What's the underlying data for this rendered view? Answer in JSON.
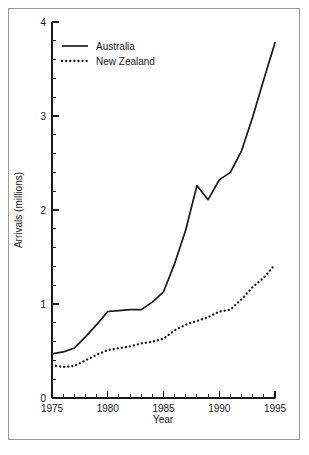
{
  "chart_data": {
    "type": "line",
    "title": "",
    "xlabel": "Year",
    "ylabel": "Arrivals (millions)",
    "xlim": [
      1975,
      1995
    ],
    "ylim": [
      0,
      4
    ],
    "grid": false,
    "legend_position": "top-left",
    "x_major_ticks": [
      1975,
      1980,
      1985,
      1990,
      1995
    ],
    "x_major_tick_labels": [
      "1975",
      "1980",
      "1985",
      "1990",
      "1995"
    ],
    "x_minor_tick_step": 1,
    "y_major_ticks": [
      0,
      1,
      2,
      3,
      4
    ],
    "y_major_tick_labels": [
      "0",
      "1",
      "2",
      "3",
      "4"
    ],
    "y_minor_tick_step": 0.2,
    "x": [
      1975,
      1976,
      1977,
      1978,
      1979,
      1980,
      1981,
      1982,
      1983,
      1984,
      1985,
      1986,
      1987,
      1988,
      1989,
      1990,
      1991,
      1992,
      1993,
      1994,
      1995
    ],
    "series": [
      {
        "name": "Australia",
        "style": "solid",
        "color": "#1a1a1a",
        "values": [
          0.47,
          0.49,
          0.53,
          0.65,
          0.78,
          0.92,
          0.93,
          0.94,
          0.94,
          1.02,
          1.13,
          1.43,
          1.79,
          2.26,
          2.11,
          2.32,
          2.4,
          2.63,
          2.99,
          3.39,
          3.78
        ]
      },
      {
        "name": "New Zealand",
        "style": "dotted",
        "color": "#1a1a1a",
        "values": [
          0.35,
          0.33,
          0.34,
          0.4,
          0.46,
          0.51,
          0.53,
          0.55,
          0.58,
          0.6,
          0.63,
          0.72,
          0.78,
          0.82,
          0.86,
          0.92,
          0.94,
          1.05,
          1.18,
          1.28,
          1.42
        ]
      }
    ]
  },
  "legend": {
    "entries": [
      {
        "label": "Australia"
      },
      {
        "label": "New Zealand"
      }
    ]
  }
}
